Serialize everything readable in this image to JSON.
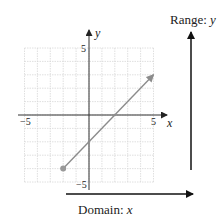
{
  "graph": {
    "x_axis": {
      "label": "x",
      "min_tick": "−5",
      "max_tick": "5"
    },
    "y_axis": {
      "label": "y",
      "max_tick": "5",
      "min_tick": "−5"
    },
    "grid": {
      "xmin": -5,
      "xmax": 5,
      "ymin": -5,
      "ymax": 5,
      "color": "#d8d8d8"
    },
    "line": {
      "equation": "y = x - 2",
      "start_point": {
        "x": -2,
        "y": -4,
        "closed": true
      },
      "end_arrow": {
        "x": 5,
        "y": 3
      },
      "color": "#8c8c8c"
    }
  },
  "range": {
    "prefix": "Range: ",
    "var": "y"
  },
  "domain": {
    "prefix": "Domain: ",
    "var": "x"
  },
  "chart_data": {
    "type": "line",
    "title": "",
    "xlabel": "x",
    "ylabel": "y",
    "xlim": [
      -5,
      5
    ],
    "ylim": [
      -5,
      5
    ],
    "grid": true,
    "series": [
      {
        "name": "y = x - 2",
        "x": [
          -2,
          5
        ],
        "y": [
          -4,
          3
        ],
        "start": "closed-dot",
        "end": "arrow"
      }
    ],
    "annotations": [
      "Range: y (vertical arrow)",
      "Domain: x (horizontal arrow)"
    ]
  }
}
